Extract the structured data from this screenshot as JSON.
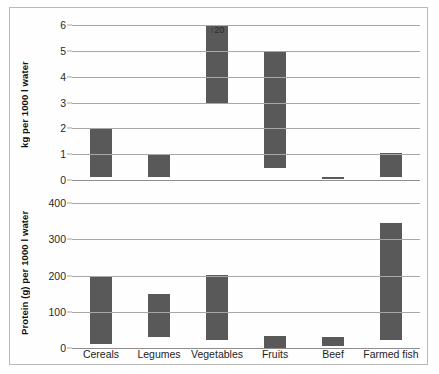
{
  "chart_data": [
    {
      "type": "bar",
      "panel": "top",
      "title": "",
      "xlabel": "",
      "ylabel": "kg per 1000 l water",
      "categories": [
        "Cereals",
        "Legumes",
        "Vegetables",
        "Fruits",
        "Beef",
        "Farmed fish"
      ],
      "yticks": [
        "0",
        "1",
        "2",
        "3",
        "4",
        "5",
        "6"
      ],
      "ytick_values": [
        0,
        1,
        2,
        3,
        4,
        5,
        6
      ],
      "ylim": [
        0,
        6
      ],
      "grid": true,
      "legend": "none",
      "bar_style": "floating-range",
      "series": [
        {
          "name": "kg per 1000 l water",
          "low": [
            0.1,
            0.1,
            3.0,
            0.45,
            0.05,
            0.1
          ],
          "high": [
            2.0,
            1.0,
            6.0,
            5.0,
            0.12,
            1.05
          ]
        }
      ],
      "annotations": [
        {
          "category": "Vegetables",
          "text": "↑20",
          "value": 20,
          "note": "bar clipped at axis maximum"
        }
      ]
    },
    {
      "type": "bar",
      "panel": "bottom",
      "title": "",
      "xlabel": "",
      "ylabel": "Protein (g) per 1000 l water",
      "categories": [
        "Cereals",
        "Legumes",
        "Vegetables",
        "Fruits",
        "Beef",
        "Farmed fish"
      ],
      "yticks": [
        "0",
        "100",
        "200",
        "300",
        "400"
      ],
      "ytick_values": [
        0,
        100,
        200,
        300,
        400
      ],
      "ylim": [
        0,
        400
      ],
      "grid": true,
      "legend": "none",
      "bar_style": "floating-range",
      "series": [
        {
          "name": "Protein (g) per 1000 l water",
          "low": [
            10,
            30,
            22,
            0,
            5,
            22
          ],
          "high": [
            200,
            150,
            202,
            32,
            30,
            345
          ]
        }
      ],
      "annotations": []
    }
  ],
  "colors": {
    "bar_fill": "#595959",
    "gridline": "#a8a8a8",
    "frame": "#b9b9b9",
    "text": "#1b1b1b"
  }
}
